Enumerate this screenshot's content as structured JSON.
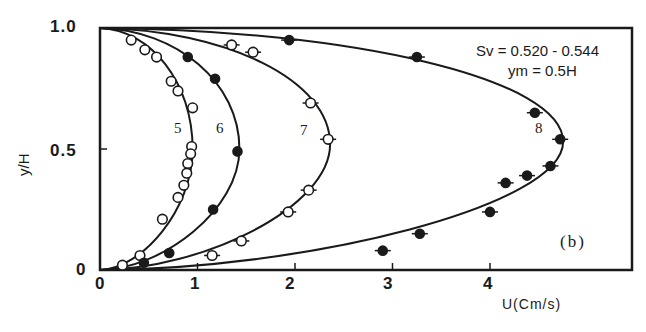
{
  "chart_data": {
    "type": "scatter",
    "title": "",
    "panel_label": "(b)",
    "xlabel": "U(Cm/s)",
    "ylabel": "y/H",
    "xlim": [
      0,
      5.5
    ],
    "ylim": [
      0,
      1.0
    ],
    "x_ticks": [
      "0",
      "1",
      "2",
      "3",
      "4"
    ],
    "y_ticks": [
      "0",
      "0.5",
      "1.0"
    ],
    "grid": false,
    "legend": "none (curves labeled inline 5, 6, 7, 8)",
    "annotations": [
      "Sv = 0.520 - 0.544",
      "ym = 0.5H"
    ],
    "series": [
      {
        "name": "5",
        "marker": "open-circle",
        "points": [
          [
            0.32,
            0.95
          ],
          [
            0.46,
            0.91
          ],
          [
            0.58,
            0.88
          ],
          [
            0.73,
            0.78
          ],
          [
            0.8,
            0.74
          ],
          [
            0.95,
            0.67
          ],
          [
            0.94,
            0.51
          ],
          [
            0.93,
            0.48
          ],
          [
            0.9,
            0.44
          ],
          [
            0.89,
            0.4
          ],
          [
            0.86,
            0.35
          ],
          [
            0.8,
            0.3
          ],
          [
            0.64,
            0.21
          ],
          [
            0.41,
            0.06
          ],
          [
            0.23,
            0.02
          ]
        ],
        "fit_peak": [
          0.95,
          0.5
        ]
      },
      {
        "name": "6",
        "marker": "filled-circle",
        "points": [
          [
            0.9,
            0.88
          ],
          [
            1.18,
            0.79
          ],
          [
            1.41,
            0.49
          ],
          [
            1.16,
            0.25
          ],
          [
            0.71,
            0.07
          ],
          [
            0.45,
            0.03
          ]
        ],
        "fit_peak": [
          1.43,
          0.5
        ]
      },
      {
        "name": "7",
        "marker": "open-circle-bar",
        "points": [
          [
            1.35,
            0.93
          ],
          [
            1.57,
            0.9
          ],
          [
            2.16,
            0.69
          ],
          [
            2.34,
            0.54
          ],
          [
            2.14,
            0.33
          ],
          [
            1.93,
            0.24
          ],
          [
            1.45,
            0.12
          ],
          [
            1.15,
            0.06
          ]
        ],
        "fit_peak": [
          2.36,
          0.52
        ]
      },
      {
        "name": "8",
        "marker": "filled-circle-bar",
        "points": [
          [
            1.94,
            0.95
          ],
          [
            3.25,
            0.88
          ],
          [
            4.46,
            0.65
          ],
          [
            4.72,
            0.54
          ],
          [
            4.62,
            0.43
          ],
          [
            4.38,
            0.39
          ],
          [
            4.16,
            0.36
          ],
          [
            4.0,
            0.24
          ],
          [
            3.28,
            0.15
          ],
          [
            2.9,
            0.08
          ]
        ],
        "fit_peak": [
          4.75,
          0.53
        ]
      }
    ]
  },
  "labels": {
    "y_tick_top": "1.0",
    "y_tick_mid": "0.5",
    "y_tick_bot": "0",
    "x_tick_0": "0",
    "x_tick_1": "1",
    "x_tick_2": "2",
    "x_tick_3": "3",
    "x_tick_4": "4",
    "ylabel": "y/H",
    "xlabel": "U(Cm/s)",
    "sv": "Sv = 0.520 - 0.544",
    "ym": "ym = 0.5H",
    "panel": "(b)",
    "c5": "5",
    "c6": "6",
    "c7": "7",
    "c8": "8"
  }
}
